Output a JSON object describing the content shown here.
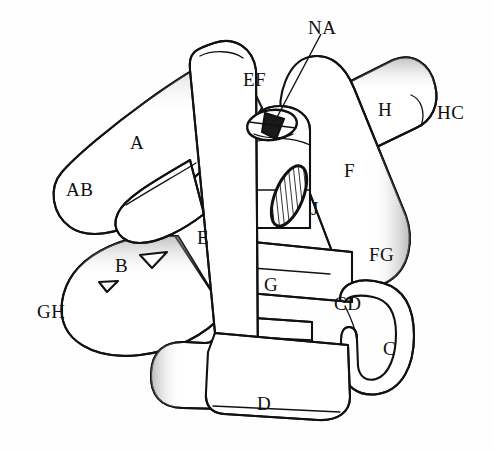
{
  "figure": {
    "kind": "knot-diagram",
    "background_color": "#ffffff",
    "ink_color": "#111111",
    "width": 494,
    "height": 451
  },
  "labels": [
    {
      "id": "NA",
      "text": "NA",
      "x": 308,
      "y": 18,
      "has_pointer": true
    },
    {
      "id": "EF",
      "text": "EF",
      "x": 243,
      "y": 70,
      "has_pointer": false
    },
    {
      "id": "H",
      "text": "H",
      "x": 378,
      "y": 100,
      "has_pointer": false
    },
    {
      "id": "HC",
      "text": "HC",
      "x": 437,
      "y": 103,
      "has_pointer": false
    },
    {
      "id": "A",
      "text": "A",
      "x": 130,
      "y": 133,
      "has_pointer": false
    },
    {
      "id": "F",
      "text": "F",
      "x": 344,
      "y": 161,
      "has_pointer": false
    },
    {
      "id": "AB",
      "text": "AB",
      "x": 66,
      "y": 180,
      "has_pointer": false
    },
    {
      "id": "J",
      "text": "J",
      "x": 311,
      "y": 199,
      "has_pointer": false
    },
    {
      "id": "E",
      "text": "E",
      "x": 197,
      "y": 228,
      "has_pointer": false
    },
    {
      "id": "FG",
      "text": "FG",
      "x": 369,
      "y": 245,
      "has_pointer": false
    },
    {
      "id": "B",
      "text": "B",
      "x": 115,
      "y": 256,
      "has_pointer": false
    },
    {
      "id": "G",
      "text": "G",
      "x": 264,
      "y": 275,
      "has_pointer": false
    },
    {
      "id": "CD",
      "text": "CD",
      "x": 334,
      "y": 294,
      "has_pointer": false
    },
    {
      "id": "GH",
      "text": "GH",
      "x": 37,
      "y": 302,
      "has_pointer": false
    },
    {
      "id": "C",
      "text": "C",
      "x": 383,
      "y": 339,
      "has_pointer": false
    },
    {
      "id": "D",
      "text": "D",
      "x": 257,
      "y": 394,
      "has_pointer": false
    }
  ],
  "pointer_line": {
    "name": "na-pointer",
    "from_x": 321,
    "from_y": 34,
    "to_x": 275,
    "to_y": 121
  },
  "features": [
    {
      "id": "NA",
      "type": "cross-section-disk",
      "shading": "dark-hatched",
      "cx": 272,
      "cy": 125
    },
    {
      "id": "J",
      "type": "cross-section-disk",
      "shading": "hatched-ellipse",
      "cx": 289,
      "cy": 196
    },
    {
      "id": "HC",
      "type": "tube-end-cap",
      "cx": 415,
      "cy": 117
    }
  ]
}
